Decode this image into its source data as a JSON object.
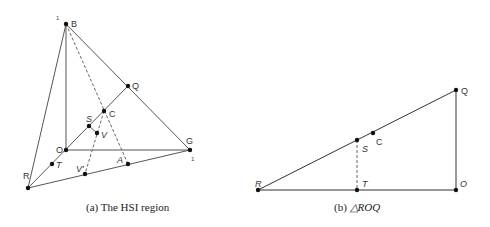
{
  "figure_a": {
    "caption": "(a) The HSI region",
    "points": {
      "B": {
        "label": "B",
        "x": 66,
        "y": 24
      },
      "Q": {
        "label": "Q",
        "x": 128,
        "y": 86
      },
      "C": {
        "label": "C",
        "x": 104,
        "y": 111
      },
      "S": {
        "label": "S",
        "x": 89,
        "y": 126
      },
      "V": {
        "label": "V",
        "x": 97,
        "y": 133
      },
      "O": {
        "label": "O",
        "x": 66,
        "y": 150
      },
      "G": {
        "label": "G",
        "x": 190,
        "y": 150
      },
      "T": {
        "label": "T",
        "x": 52,
        "y": 164
      },
      "V_prime": {
        "label": "V'",
        "x": 85,
        "y": 174
      },
      "A": {
        "label": "A",
        "x": 128,
        "y": 164
      },
      "R": {
        "label": "R",
        "x": 28,
        "y": 188
      }
    },
    "tick_B": "1",
    "tick_G": "1"
  },
  "figure_b": {
    "caption_prefix": "(b) ",
    "caption_math": "△ROQ",
    "points": {
      "R": {
        "label": "R",
        "x": 258,
        "y": 190
      },
      "T": {
        "label": "T",
        "x": 357,
        "y": 190
      },
      "O": {
        "label": "O",
        "x": 456,
        "y": 190
      },
      "Q": {
        "label": "Q",
        "x": 456,
        "y": 90
      },
      "S": {
        "label": "S",
        "x": 357,
        "y": 140
      },
      "C": {
        "label": "C",
        "x": 373,
        "y": 133
      }
    }
  }
}
